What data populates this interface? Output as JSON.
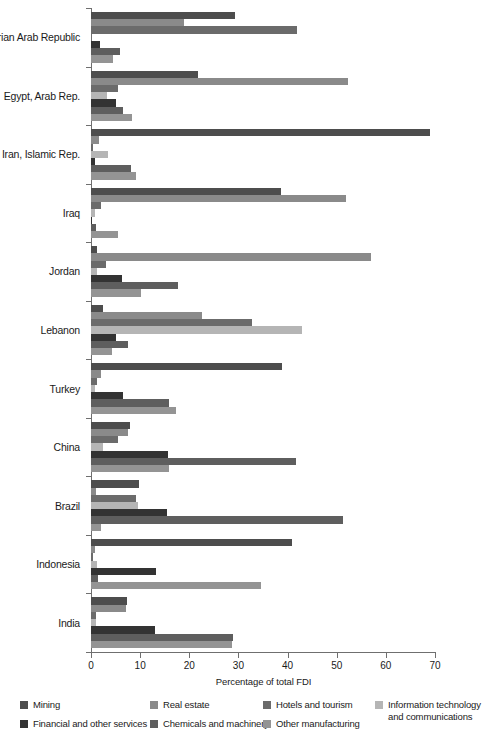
{
  "chart_data": {
    "type": "bar",
    "orientation": "horizontal",
    "title": "",
    "xlabel": "Percentage of total FDI",
    "ylabel": "",
    "xlim": [
      0,
      70
    ],
    "xticks": [
      0,
      10,
      20,
      30,
      40,
      50,
      60,
      70
    ],
    "grid": false,
    "legend_position": "bottom",
    "categories": [
      "Syrian Arab Republic",
      "Egypt, Arab Rep.",
      "Iran, Islamic Rep.",
      "Iraq",
      "Jordan",
      "Lebanon",
      "Turkey",
      "China",
      "Brazil",
      "Indonesia",
      "India"
    ],
    "series": [
      {
        "name": "Mining",
        "color": "#4d4d4d",
        "values": [
          29.3,
          21.8,
          69.0,
          38.6,
          1.2,
          2.5,
          38.8,
          8.0,
          9.8,
          40.8,
          7.3
        ]
      },
      {
        "name": "Real estate",
        "color": "#8a8a8a",
        "values": [
          18.9,
          52.3,
          1.6,
          51.8,
          57.0,
          22.5,
          2.0,
          7.5,
          1.0,
          0.9,
          7.2
        ]
      },
      {
        "name": "Hotels and tourism",
        "color": "#6b6b6b",
        "values": [
          42.0,
          5.5,
          0.5,
          2.0,
          3.0,
          32.8,
          1.2,
          5.5,
          9.2,
          0.4,
          1.0
        ]
      },
      {
        "name": "Information technology and communications",
        "color": "#b5b5b5",
        "values": [
          0.0,
          3.2,
          3.4,
          0.8,
          1.3,
          43.0,
          0.8,
          2.5,
          9.6,
          1.2,
          1.0
        ]
      },
      {
        "name": "Financial and other services",
        "color": "#333333",
        "values": [
          1.8,
          5.0,
          0.9,
          0.3,
          6.3,
          5.0,
          6.5,
          15.6,
          15.4,
          13.2,
          13.0
        ]
      },
      {
        "name": "Chemicals and machinery",
        "color": "#5e5e5e",
        "values": [
          6.0,
          6.6,
          8.2,
          1.0,
          17.8,
          7.5,
          15.9,
          41.8,
          51.2,
          1.5,
          28.8
        ]
      },
      {
        "name": "Other manufacturing",
        "color": "#949494",
        "values": [
          4.4,
          8.4,
          9.2,
          5.4,
          10.2,
          4.2,
          17.3,
          15.8,
          2.0,
          34.5,
          28.7
        ]
      }
    ]
  },
  "legend": {
    "items": [
      {
        "label": "Mining",
        "color": "#4d4d4d"
      },
      {
        "label": "Real estate",
        "color": "#8a8a8a"
      },
      {
        "label": "Hotels and tourism",
        "color": "#6b6b6b"
      },
      {
        "label": "Information technology and communications",
        "color": "#b5b5b5"
      },
      {
        "label": "Financial and other services",
        "color": "#333333"
      },
      {
        "label": "Chemicals and machinery",
        "color": "#5e5e5e"
      },
      {
        "label": "Other manufacturing",
        "color": "#949494"
      }
    ]
  },
  "axis": {
    "x_title": "Percentage of total FDI",
    "tick_labels": [
      "0",
      "10",
      "20",
      "30",
      "40",
      "50",
      "60",
      "70"
    ]
  }
}
